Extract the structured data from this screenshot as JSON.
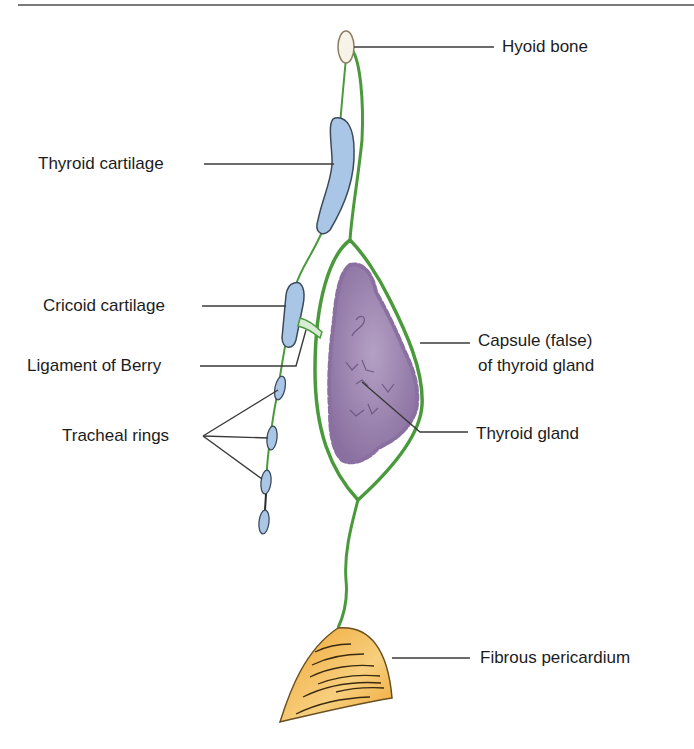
{
  "figure": {
    "labels": {
      "hyoid_bone": "Hyoid bone",
      "thyroid_cartilage": "Thyroid cartilage",
      "cricoid_cartilage": "Cricoid cartilage",
      "ligament_of_berry": "Ligament of Berry",
      "tracheal_rings": "Tracheal rings",
      "capsule_line1": "Capsule (false)",
      "capsule_line2": "of thyroid gland",
      "thyroid_gland": "Thyroid gland",
      "fibrous_pericardium": "Fibrous pericardium"
    },
    "colors": {
      "fascia_green": "#4a9a3c",
      "cartilage_blue": "#a9c6e6",
      "gland_purple": "#9a82ab",
      "pericardium_orange": "#f2b347",
      "leader_line": "#3a3a3a"
    }
  }
}
